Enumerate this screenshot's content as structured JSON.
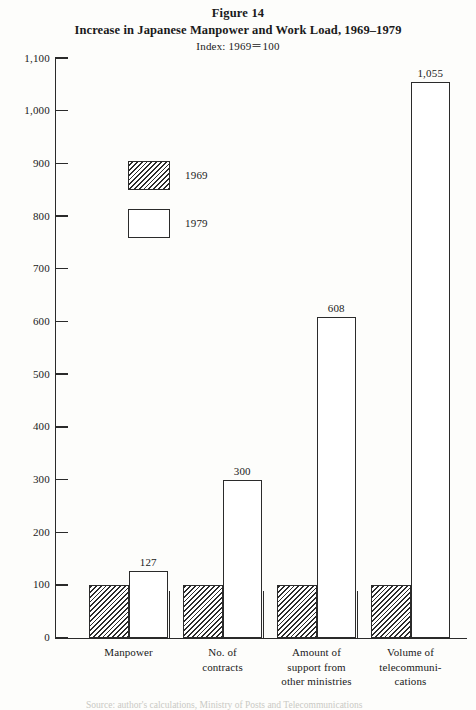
{
  "figure": {
    "label": "Figure 14",
    "title": "Increase in Japanese Manpower and Work Load, 1969–1979",
    "subtitle": "Index: 1969＝100"
  },
  "legend": {
    "position": "inside-top-left",
    "items": [
      {
        "label": "1969",
        "swatch": "hatched-diagonal"
      },
      {
        "label": "1979",
        "swatch": "open-white"
      }
    ]
  },
  "axis": {
    "y_ticks": [
      "0",
      "100",
      "200",
      "300",
      "400",
      "500",
      "600",
      "700",
      "800",
      "900",
      "1,000",
      "1,100"
    ],
    "y_min": 0,
    "y_max": 1100,
    "y_step": 100
  },
  "source_note": "Source: author's calculations, Ministry of Posts and Telecommunications",
  "chart_data": {
    "type": "bar",
    "title": "Increase in Japanese Manpower and Work Load, 1969–1979",
    "subtitle": "Index: 1969＝100",
    "xlabel": "",
    "ylabel": "",
    "ylim": [
      0,
      1100
    ],
    "ytick_step": 100,
    "yticks": [
      0,
      100,
      200,
      300,
      400,
      500,
      600,
      700,
      800,
      900,
      1000,
      1100
    ],
    "grid": false,
    "legend_position": "upper-left-inside",
    "categories": [
      "Manpower",
      "No. of contracts",
      "Amount of support from other ministries",
      "Volume of telecommunications"
    ],
    "category_lines": [
      [
        "Manpower"
      ],
      [
        "No. of",
        "contracts"
      ],
      [
        "Amount of",
        "support from",
        "other ministries"
      ],
      [
        "Volume of",
        "telecommuni-",
        "cations"
      ]
    ],
    "series": [
      {
        "name": "1969",
        "fill": "hatched-diagonal",
        "values": [
          100,
          100,
          100,
          100
        ],
        "value_labels": [
          "",
          "",
          "",
          ""
        ]
      },
      {
        "name": "1979",
        "fill": "open-white",
        "values": [
          127,
          300,
          608,
          1055
        ],
        "value_labels": [
          "127",
          "300",
          "608",
          "1,055"
        ]
      }
    ]
  },
  "colors": {
    "ink": "#2b2b2b",
    "paper": "#fdfdfb"
  }
}
